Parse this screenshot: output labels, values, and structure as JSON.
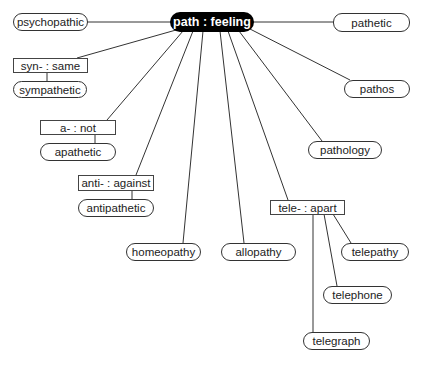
{
  "diagram": {
    "root": {
      "label": "path : feeling"
    },
    "prefixes": [
      {
        "id": "syn",
        "label": "syn- : same"
      },
      {
        "id": "a",
        "label": "a- : not"
      },
      {
        "id": "anti",
        "label": "anti- : against"
      },
      {
        "id": "tele",
        "label": "tele- : apart"
      }
    ],
    "words": [
      {
        "id": "psychopathic",
        "label": "psychopathic",
        "parent": "root"
      },
      {
        "id": "pathetic",
        "label": "pathetic",
        "parent": "root"
      },
      {
        "id": "sympathetic",
        "label": "sympathetic",
        "parent": "syn"
      },
      {
        "id": "pathos",
        "label": "pathos",
        "parent": "root"
      },
      {
        "id": "apathetic",
        "label": "apathetic",
        "parent": "a"
      },
      {
        "id": "pathology",
        "label": "pathology",
        "parent": "root"
      },
      {
        "id": "antipathetic",
        "label": "antipathetic",
        "parent": "anti"
      },
      {
        "id": "homeopathy",
        "label": "homeopathy",
        "parent": "root"
      },
      {
        "id": "allopathy",
        "label": "allopathy",
        "parent": "root"
      },
      {
        "id": "telepathy",
        "label": "telepathy",
        "parent": "tele"
      },
      {
        "id": "telephone",
        "label": "telephone",
        "parent": "tele"
      },
      {
        "id": "telegraph",
        "label": "telegraph",
        "parent": "tele"
      }
    ]
  }
}
